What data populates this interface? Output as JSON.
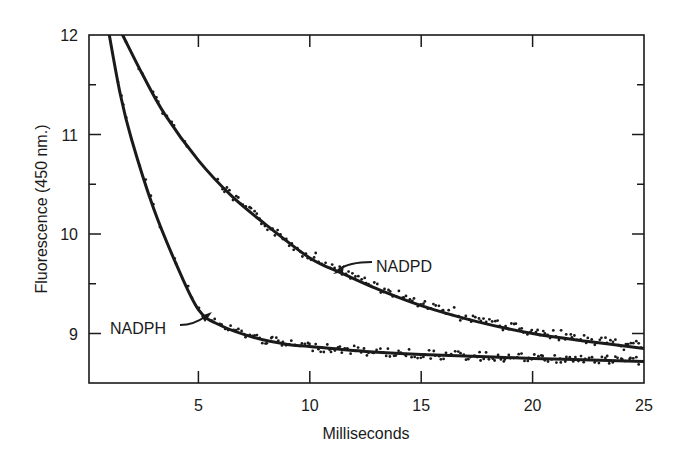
{
  "chart_data": {
    "type": "line",
    "title": "",
    "xlabel": "Milliseconds",
    "ylabel": "Fluorescence (450 nm.)",
    "xlim": [
      0,
      25
    ],
    "ylim": [
      8.5,
      12
    ],
    "x_ticks": [
      5,
      10,
      15,
      20,
      25
    ],
    "x_tick_labels": [
      "5",
      "10",
      "15",
      "20",
      "25"
    ],
    "y_ticks": [
      9,
      10,
      11,
      12
    ],
    "y_tick_labels": [
      "9",
      "10",
      "11",
      "12"
    ],
    "y_minor_ticks": [
      8.5,
      9.5,
      10.5,
      11.5
    ],
    "grid": false,
    "legend": "none (inline arrow annotations)",
    "series": [
      {
        "name": "NADPD",
        "style": "fitted curve with scattered data points",
        "x": [
          1.6,
          2.5,
          3.5,
          5,
          6.5,
          8,
          10,
          11.5,
          13,
          15,
          17.5,
          20,
          22.5,
          25
        ],
        "values": [
          12.0,
          11.6,
          11.2,
          10.74,
          10.38,
          10.1,
          9.76,
          9.6,
          9.45,
          9.28,
          9.12,
          9.0,
          8.92,
          8.85
        ]
      },
      {
        "name": "NADPH",
        "style": "fitted curve with scattered data points",
        "x": [
          1.0,
          1.5,
          2,
          3,
          4,
          5,
          6,
          7.5,
          9,
          10,
          12.5,
          15,
          20,
          25
        ],
        "values": [
          12.0,
          11.4,
          10.95,
          10.25,
          9.7,
          9.24,
          9.08,
          8.96,
          8.89,
          8.87,
          8.82,
          8.79,
          8.75,
          8.72
        ]
      }
    ],
    "annotations": [
      {
        "text": "NADPD",
        "arrow_to": {
          "x": 11.3,
          "y": 9.62
        }
      },
      {
        "text": "NADPH",
        "arrow_to": {
          "x": 5.7,
          "y": 9.22
        }
      }
    ]
  },
  "labels": {
    "xlabel": "Milliseconds",
    "ylabel": "Fluorescence (450 nm.)",
    "nadpd": "NADPD",
    "nadph": "NADPH"
  }
}
